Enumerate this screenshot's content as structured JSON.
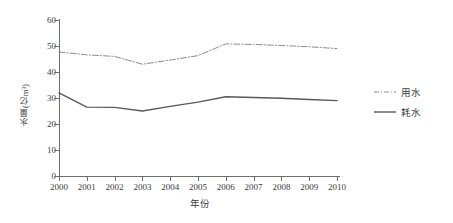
{
  "chart_data": {
    "type": "line",
    "title": "",
    "xlabel": "年份",
    "ylabel": "水量(亿m³)",
    "categories": [
      "2000",
      "2001",
      "2002",
      "2003",
      "2004",
      "2005",
      "2006",
      "2007",
      "2008",
      "2009",
      "2010"
    ],
    "x": [
      2000,
      2001,
      2002,
      2003,
      2004,
      2005,
      2006,
      2007,
      2008,
      2009,
      2010
    ],
    "ylim": [
      0,
      60
    ],
    "yticks": [
      0,
      10,
      20,
      30,
      40,
      50,
      60
    ],
    "grid": false,
    "legend_position": "right",
    "series": [
      {
        "name": "用水",
        "linestyle": "dash-dot",
        "color": "#8c8c8c",
        "values": [
          47.7,
          46.6,
          46.0,
          43.0,
          44.6,
          46.3,
          50.8,
          50.6,
          50.2,
          49.7,
          49.0
        ]
      },
      {
        "name": "耗水",
        "linestyle": "solid",
        "color": "#595959",
        "values": [
          32.0,
          26.5,
          26.4,
          25.0,
          26.8,
          28.4,
          30.5,
          30.2,
          29.9,
          29.4,
          29.0
        ]
      }
    ]
  },
  "axes": {
    "y_title": "水量(亿m³)",
    "x_title": "年份",
    "y_tick_labels": [
      "60",
      "50",
      "40",
      "30",
      "20",
      "10",
      "0"
    ],
    "x_tick_labels": [
      "2000",
      "2001",
      "2002",
      "2003",
      "2004",
      "2005",
      "2006",
      "2007",
      "2008",
      "2009",
      "2010"
    ]
  },
  "legend": {
    "items": [
      {
        "label": "用水",
        "style": "dash-dot"
      },
      {
        "label": "耗水",
        "style": "solid"
      }
    ]
  },
  "colors": {
    "axis": "#6e6e6e",
    "series_use": "#8c8c8c",
    "series_consume": "#595959",
    "text": "#3a3a3a",
    "background": "#ffffff"
  }
}
